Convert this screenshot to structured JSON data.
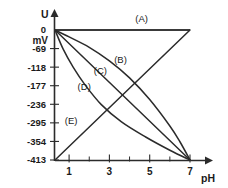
{
  "chart_data": {
    "type": "line",
    "title": "",
    "xlabel": "pH",
    "ylabel": "U",
    "yunit": "mV",
    "xlim": [
      0.3,
      7
    ],
    "ylim": [
      -413,
      0
    ],
    "grid": false,
    "legend_position": "inline-labels",
    "x_ticks": [
      {
        "value": 1,
        "label": "1",
        "major": true
      },
      {
        "value": 2,
        "label": "",
        "major": false
      },
      {
        "value": 3,
        "label": "3",
        "major": true
      },
      {
        "value": 4,
        "label": "",
        "major": false
      },
      {
        "value": 5,
        "label": "5",
        "major": true
      },
      {
        "value": 6,
        "label": "",
        "major": false
      },
      {
        "value": 7,
        "label": "7",
        "major": true
      }
    ],
    "y_ticks": [
      {
        "value": 0,
        "label": "0"
      },
      {
        "value": -59,
        "label": "-69"
      },
      {
        "value": -118,
        "label": "-118"
      },
      {
        "value": -177,
        "label": "-177"
      },
      {
        "value": -236,
        "label": "-236"
      },
      {
        "value": -295,
        "label": "-295"
      },
      {
        "value": -354,
        "label": "-354"
      },
      {
        "value": -413,
        "label": "-413"
      }
    ],
    "series": [
      {
        "name": "A",
        "label": "(A)",
        "shape": "horizontal",
        "points": [
          [
            0.3,
            0
          ],
          [
            7,
            0
          ]
        ],
        "label_pos": [
          4.6,
          22
        ]
      },
      {
        "name": "B",
        "label": "(B)",
        "shape": "concave-down",
        "points": [
          [
            0.3,
            0
          ],
          [
            1.0,
            -22
          ],
          [
            2.0,
            -55
          ],
          [
            3.0,
            -98
          ],
          [
            4.0,
            -152
          ],
          [
            5.0,
            -221
          ],
          [
            6.0,
            -305
          ],
          [
            6.5,
            -355
          ],
          [
            7,
            -413
          ]
        ],
        "label_pos": [
          3.55,
          -105
        ]
      },
      {
        "name": "C",
        "label": "(C)",
        "shape": "linear",
        "points": [
          [
            0.3,
            0
          ],
          [
            7,
            -413
          ]
        ],
        "label_pos": [
          2.55,
          -140
        ]
      },
      {
        "name": "D",
        "label": "(D)",
        "shape": "convex",
        "points": [
          [
            0.3,
            0
          ],
          [
            0.7,
            -60
          ],
          [
            1.2,
            -118
          ],
          [
            1.8,
            -175
          ],
          [
            2.6,
            -237
          ],
          [
            3.6,
            -292
          ],
          [
            4.8,
            -340
          ],
          [
            6.0,
            -382
          ],
          [
            7,
            -413
          ]
        ],
        "label_pos": [
          1.75,
          -190
        ]
      },
      {
        "name": "E",
        "label": "(E)",
        "shape": "linear-rising",
        "points": [
          [
            0.3,
            -413
          ],
          [
            7,
            0
          ]
        ],
        "label_pos": [
          1.1,
          -300
        ]
      }
    ]
  },
  "axes": {
    "y_axis_title": "U",
    "y_axis_unit": "mV",
    "x_axis_title": "pH"
  }
}
